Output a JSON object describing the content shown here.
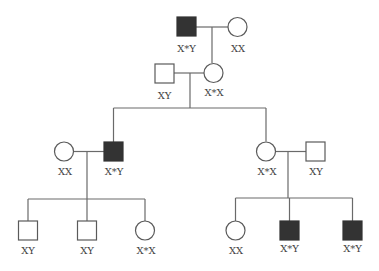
{
  "diagram": {
    "type": "pedigree",
    "colors": {
      "line": "#6a6a6a",
      "affected_fill": "#333333",
      "unaffected_fill": "#ffffff"
    },
    "individuals": {
      "g1_male": {
        "sex": "male",
        "affected": true,
        "label": "X*Y"
      },
      "g1_female": {
        "sex": "female",
        "affected": false,
        "label": "XX"
      },
      "g2_male": {
        "sex": "male",
        "affected": false,
        "label": "XY"
      },
      "g2_female": {
        "sex": "female",
        "affected": false,
        "label": "X*X"
      },
      "g3_left_female": {
        "sex": "female",
        "affected": false,
        "label": "XX"
      },
      "g3_left_male": {
        "sex": "male",
        "affected": true,
        "label": "X*Y"
      },
      "g3_right_female": {
        "sex": "female",
        "affected": false,
        "label": "X*X"
      },
      "g3_right_male": {
        "sex": "male",
        "affected": false,
        "label": "XY"
      },
      "g4_child1": {
        "sex": "male",
        "affected": false,
        "label": "XY"
      },
      "g4_child2": {
        "sex": "male",
        "affected": false,
        "label": "XY"
      },
      "g4_child3": {
        "sex": "female",
        "affected": false,
        "label": "X*X"
      },
      "g4_child4": {
        "sex": "female",
        "affected": false,
        "label": "XX"
      },
      "g4_child5": {
        "sex": "male",
        "affected": true,
        "label": "X*Y"
      },
      "g4_child6": {
        "sex": "male",
        "affected": true,
        "label": "X*Y"
      }
    }
  }
}
